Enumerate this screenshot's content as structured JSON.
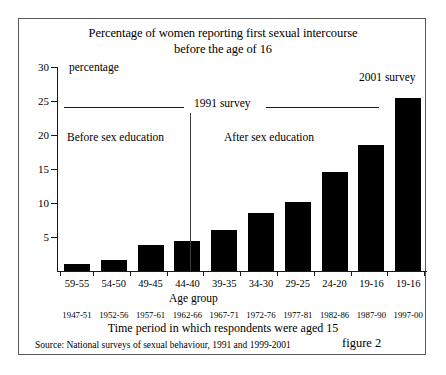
{
  "figure": {
    "title_line1": "Percentage of women reporting first sexual intercourse",
    "title_line2": "before the age of 16",
    "figure_number": "figure 2",
    "source": "Source: National surveys of sexual behaviour, 1991 and 1999-2001"
  },
  "annotations": {
    "survey_1991": "1991 survey",
    "survey_2001": "2001 survey",
    "before_education": "Before sex education",
    "after_education": "After sex education",
    "age_group_caption": "Age group"
  },
  "chart_data": {
    "type": "bar",
    "title": "Percentage of women reporting first sexual intercourse before the age of 16",
    "xlabel": "Time period in which respondents were aged 15",
    "ylabel": "percentage",
    "ylim": [
      0,
      30
    ],
    "yticks": [
      5,
      10,
      15,
      20,
      25,
      30
    ],
    "grid": false,
    "legend": false,
    "categories": [
      "59-55",
      "54-50",
      "49-45",
      "44-40",
      "39-35",
      "34-30",
      "29-25",
      "24-20",
      "19-16",
      "19-16"
    ],
    "period_labels": [
      "1947-51",
      "1952-56",
      "1957-61",
      "1962-66",
      "1967-71",
      "1972-76",
      "1977-81",
      "1982-86",
      "1987-90",
      "1997-00"
    ],
    "values": [
      1.0,
      1.6,
      3.8,
      4.4,
      6.0,
      8.5,
      10.1,
      14.6,
      18.6,
      25.5
    ],
    "bar_color": "#000000",
    "series_groups": [
      {
        "name": "1991 survey",
        "category_indices": [
          0,
          1,
          2,
          3,
          4,
          5,
          6,
          7,
          8
        ]
      },
      {
        "name": "2001 survey",
        "category_indices": [
          9
        ]
      }
    ],
    "divider_after_index": 3,
    "divider_note": "vertical line separating Before sex education from After sex education"
  }
}
